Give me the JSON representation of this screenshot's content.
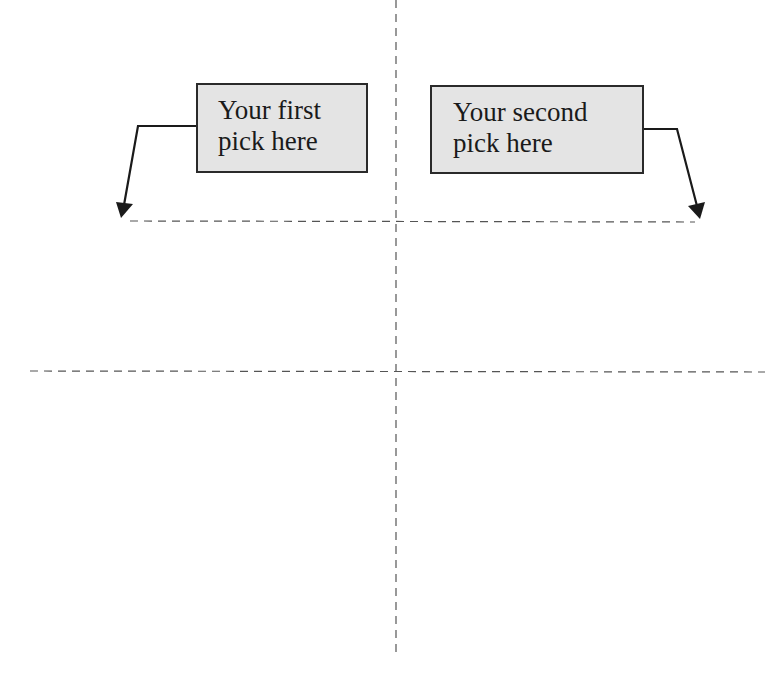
{
  "diagram": {
    "boxes": [
      {
        "id": "first",
        "line1": "Your first",
        "line2": "pick here"
      },
      {
        "id": "second",
        "line1": "Your second",
        "line2": "pick here"
      }
    ],
    "colors": {
      "box_fill": "#e4e4e4",
      "box_border": "#2a2a2a",
      "text": "#1a1a1a",
      "arrow": "#1a1a1a",
      "dashed_line": "#555555",
      "background": "#ffffff"
    }
  }
}
